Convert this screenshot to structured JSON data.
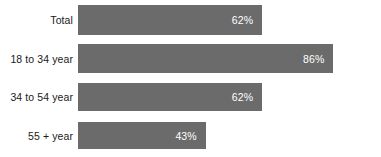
{
  "chart_data": {
    "type": "bar",
    "orientation": "horizontal",
    "title": "",
    "subtitle": "",
    "xlabel": "",
    "ylabel": "",
    "grid": false,
    "legend": null,
    "xlim": [
      0,
      100
    ],
    "value_suffix": "%",
    "categories": [
      "Total",
      "18 to 34 year",
      "34 to 54 year",
      "55 + year"
    ],
    "values": [
      62,
      86,
      62,
      43
    ],
    "value_labels": [
      "62%",
      "86%",
      "62%",
      "43%"
    ],
    "bars": [
      {
        "category": "Total",
        "value": 62,
        "label": "62%"
      },
      {
        "category": "18 to 34 year",
        "value": 86,
        "label": "86%"
      },
      {
        "category": "34 to 54 year",
        "value": 62,
        "label": "62%"
      },
      {
        "category": "55 + year",
        "value": 43,
        "label": "43%"
      }
    ]
  },
  "colors": {
    "bar": "#6b6b6b",
    "background": "#ffffff",
    "category_text": "#1a1a1a",
    "value_text": "#ffffff"
  },
  "layout": {
    "bar_start_x": 78,
    "bar_max_width": 297,
    "label_right_edge": 73,
    "rows": [
      {
        "top": 5,
        "height": 30
      },
      {
        "top": 44,
        "height": 29
      },
      {
        "top": 83,
        "height": 28
      },
      {
        "top": 122,
        "height": 27
      }
    ]
  }
}
